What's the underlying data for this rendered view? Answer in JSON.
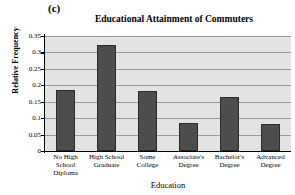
{
  "figure": {
    "panel_letter": "(c)",
    "background_color": "#ffffff",
    "plot_background_color": "#e3e3e3",
    "bar_color": "#4d4d4d",
    "gridline_color": "#9a9a9a",
    "axis_color": "#000000"
  },
  "chart_data": {
    "type": "bar",
    "title": "Educational Attainment of Commuters",
    "xlabel": "Education",
    "ylabel": "Relative Frequency",
    "categories": [
      "No High School Diploma",
      "High School Graduate",
      "Some College",
      "Associate's Degree",
      "Bachelor's Degree",
      "Advanced Degree"
    ],
    "category_lines": [
      [
        "No High",
        "School",
        "Diploma"
      ],
      [
        "High School",
        "Graduate"
      ],
      [
        "Some",
        "College"
      ],
      [
        "Associate's",
        "Degree"
      ],
      [
        "Bachelor's",
        "Degree"
      ],
      [
        "Advanced",
        "Degree"
      ]
    ],
    "values": [
      0.186,
      0.322,
      0.183,
      0.086,
      0.163,
      0.083
    ],
    "ylim": [
      0,
      0.35
    ],
    "yticks": [
      0,
      0.05,
      0.1,
      0.15,
      0.2,
      0.25,
      0.3,
      0.35
    ],
    "ytick_labels": [
      "0",
      "0.05",
      "0.1",
      "0.15",
      "0.2",
      "0.25",
      "0.3",
      "0.35"
    ],
    "grid": true,
    "legend": false,
    "legend_position": "none"
  }
}
